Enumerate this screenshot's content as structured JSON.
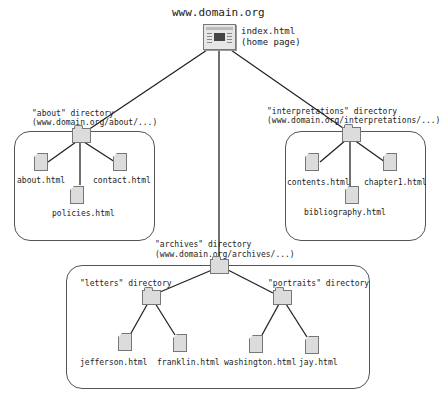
{
  "root": {
    "domain": "www.domain.org",
    "home_file": "index.html",
    "home_note": "(home page)"
  },
  "directories": {
    "about": {
      "label": "\"about\" directory",
      "path": "(www.domain.org/about/...)",
      "files": [
        "about.html",
        "policies.html",
        "contact.html"
      ]
    },
    "interpretations": {
      "label": "\"interpretations\" directory",
      "path": "(www.domain.org/interpretations/...)",
      "files": [
        "contents.html",
        "bibliography.html",
        "chapter1.html"
      ]
    },
    "archives": {
      "label": "\"archives\" directory",
      "path": "(www.domain.org/archives/...)",
      "subdirectories": {
        "letters": {
          "label": "\"letters\" directory",
          "files": [
            "jefferson.html",
            "franklin.html"
          ]
        },
        "portraits": {
          "label": "\"portraits\" directory",
          "files": [
            "washington.html",
            "jay.html"
          ]
        }
      }
    }
  },
  "colors": {
    "line": "#222222",
    "icon_fill": "#dcdcdc",
    "icon_border": "#777777",
    "box_border": "#555555"
  }
}
